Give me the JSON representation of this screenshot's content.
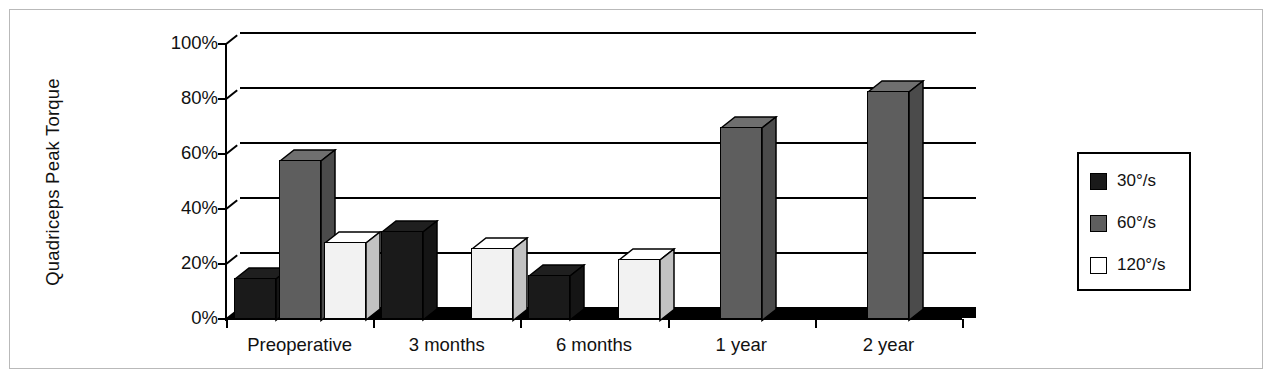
{
  "chart_data": {
    "type": "bar",
    "title": "",
    "xlabel": "",
    "ylabel": "Quadriceps Peak Torque",
    "ylim": [
      0,
      100
    ],
    "yticks": [
      "0%",
      "20%",
      "40%",
      "60%",
      "80%",
      "100%"
    ],
    "grid": true,
    "legend_position": "right",
    "style": "3d-grouped-column",
    "categories": [
      "Preoperative",
      "3 months",
      "6 months",
      "1 year",
      "2 year"
    ],
    "series": [
      {
        "name": "30°/s",
        "color": "#1a1a1a",
        "values": [
          15,
          32,
          16,
          null,
          null
        ]
      },
      {
        "name": "60°/s",
        "color": "#5e5e5e",
        "values": [
          58,
          null,
          null,
          70,
          83
        ]
      },
      {
        "name": "120°/s",
        "color": "#f2f2f2",
        "values": [
          28,
          26,
          22,
          null,
          null
        ]
      }
    ]
  },
  "legend": {
    "items": [
      {
        "label": "30°/s",
        "swatch": "#1a1a1a"
      },
      {
        "label": "60°/s",
        "swatch": "#5e5e5e"
      },
      {
        "label": "120°/s",
        "swatch": "#ffffff"
      }
    ]
  }
}
